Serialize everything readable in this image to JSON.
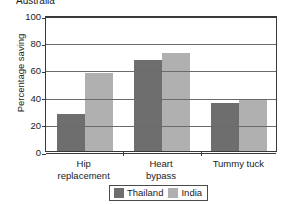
{
  "chart_data": {
    "type": "bar",
    "title": "Australia",
    "subtitle": "",
    "xlabel": "",
    "ylabel": "Percentage saving",
    "categories": [
      "Hip replacement",
      "Heart bypass",
      "Tummy tuck"
    ],
    "category_lines": [
      [
        "Hip",
        "replacement"
      ],
      [
        "Heart",
        "bypass"
      ],
      [
        "Tummy tuck"
      ]
    ],
    "series": [
      {
        "name": "Thailand",
        "color": "#6e6e6e",
        "values": [
          27,
          67,
          35
        ]
      },
      {
        "name": "India",
        "color": "#b0b0b0",
        "values": [
          57,
          72,
          38
        ]
      }
    ],
    "ylim": [
      0,
      100
    ],
    "yticks": [
      0,
      20,
      40,
      60,
      80,
      100
    ],
    "ytick_labels": [
      "0",
      "20",
      "40",
      "60",
      "80",
      "100"
    ],
    "grid": true,
    "grid_axis": "y",
    "legend_position": "bottom",
    "axis_color": "#3a3a3a",
    "grid_color": "#6b6b6b",
    "background": "#ffffff"
  },
  "legend": {
    "entries": [
      {
        "label": "Thailand",
        "color": "#6e6e6e"
      },
      {
        "label": "India",
        "color": "#b0b0b0"
      }
    ]
  }
}
